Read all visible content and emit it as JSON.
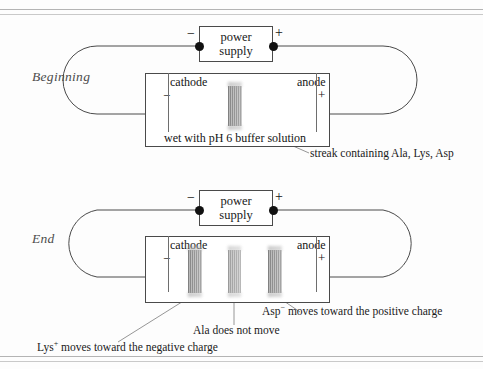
{
  "figure": {
    "accent_band_color": "#8d8d8d",
    "line_color": "#4a4a4a"
  },
  "panels": [
    {
      "id": "beginning",
      "stage_label": "Beginning",
      "power_supply": {
        "line1": "power",
        "line2": "supply",
        "negative_sign": "−",
        "positive_sign": "+"
      },
      "chamber": {
        "cathode_label": "cathode",
        "cathode_sign": "−",
        "anode_label": "anode",
        "anode_sign": "+",
        "buffer_text": "wet with pH 6 buffer solution"
      },
      "bands": [
        {
          "name": "streak-all",
          "x_pct": 45.0
        }
      ],
      "annotations": [
        {
          "name": "streak-caption",
          "text": "streak containing Ala, Lys, Asp"
        }
      ]
    },
    {
      "id": "end",
      "stage_label": "End",
      "power_supply": {
        "line1": "power",
        "line2": "supply",
        "negative_sign": "−",
        "positive_sign": "+"
      },
      "chamber": {
        "cathode_label": "cathode",
        "cathode_sign": "−",
        "anode_label": "anode",
        "anode_sign": "+",
        "buffer_text": ""
      },
      "bands": [
        {
          "name": "band-lys",
          "x_pct": 23.0
        },
        {
          "name": "band-ala",
          "x_pct": 45.0
        },
        {
          "name": "band-asp",
          "x_pct": 67.0
        }
      ],
      "annotations": [
        {
          "name": "lys-caption",
          "prefix": "Lys",
          "sup": "+",
          "text": " moves toward the negative charge"
        },
        {
          "name": "ala-caption",
          "prefix": "Ala",
          "sup": "",
          "text": " does not move"
        },
        {
          "name": "asp-caption",
          "prefix": "Asp",
          "sup": "−",
          "text": " moves toward the positive charge"
        }
      ]
    }
  ],
  "captions": {
    "streak": "streak containing Ala, Lys, Asp",
    "lys_prefix": "Lys",
    "lys_sup": "+",
    "lys_rest": " moves toward the negative charge",
    "ala_full": "Ala does not move",
    "asp_prefix": "Asp",
    "asp_sup": "−",
    "asp_rest": " moves toward the positive charge"
  }
}
